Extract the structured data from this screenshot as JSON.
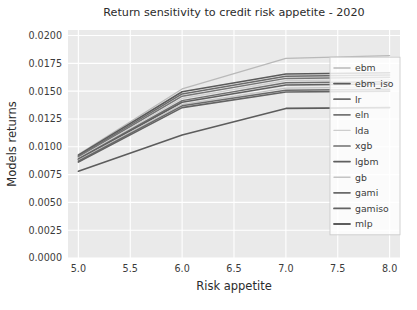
{
  "chart_data": {
    "type": "line",
    "title": "Return sensitivity to credit risk appetite - 2020",
    "xlabel": "Risk appetite",
    "ylabel": "Models returns",
    "xlim": [
      4.9,
      8.1
    ],
    "ylim": [
      0.0,
      0.0205
    ],
    "grid": true,
    "grid_color": "#ffffff",
    "plot_bg": "#eaeaea",
    "legend_position": "center right",
    "xticks": [
      5.0,
      5.5,
      6.0,
      6.5,
      7.0,
      7.5,
      8.0
    ],
    "xticklabels": [
      "5.0",
      "5.5",
      "6.0",
      "6.5",
      "7.0",
      "7.5",
      "8.0"
    ],
    "yticks": [
      0.0,
      0.0025,
      0.005,
      0.0075,
      0.01,
      0.0125,
      0.015,
      0.0175,
      0.02
    ],
    "yticklabels": [
      "0.0000",
      "0.0025",
      "0.0050",
      "0.0075",
      "0.0100",
      "0.0125",
      "0.0150",
      "0.0175",
      "0.0200"
    ],
    "x": [
      5.0,
      6.0,
      7.0,
      8.0
    ],
    "series": [
      {
        "name": "ebm",
        "color": "#b9b9b9",
        "width": 1.3,
        "values": [
          0.0093,
          0.0152,
          0.01795,
          0.0182
        ]
      },
      {
        "name": "ebm_iso",
        "color": "#5a5a5a",
        "width": 1.6,
        "values": [
          0.00925,
          0.01495,
          0.01655,
          0.01665
        ]
      },
      {
        "name": "lr",
        "color": "#6b6b6b",
        "width": 1.5,
        "values": [
          0.00915,
          0.01475,
          0.01635,
          0.01645
        ]
      },
      {
        "name": "eln",
        "color": "#757575",
        "width": 1.5,
        "values": [
          0.00908,
          0.01455,
          0.01615,
          0.01625
        ]
      },
      {
        "name": "lda",
        "color": "#cdcdcd",
        "width": 1.2,
        "values": [
          0.009,
          0.01435,
          0.01595,
          0.01605
        ]
      },
      {
        "name": "xgb",
        "color": "#6f6f6f",
        "width": 1.5,
        "values": [
          0.00892,
          0.01415,
          0.01575,
          0.01585
        ]
      },
      {
        "name": "lgbm",
        "color": "#5f5f5f",
        "width": 1.6,
        "values": [
          0.00885,
          0.014,
          0.01555,
          0.01565
        ]
      },
      {
        "name": "gb",
        "color": "#c4c4c4",
        "width": 1.2,
        "values": [
          0.00878,
          0.01382,
          0.01528,
          0.01538
        ]
      },
      {
        "name": "gami",
        "color": "#6a6a6a",
        "width": 1.5,
        "values": [
          0.0087,
          0.01368,
          0.01508,
          0.01518
        ]
      },
      {
        "name": "gamiso",
        "color": "#636363",
        "width": 1.6,
        "values": [
          0.00862,
          0.01352,
          0.01492,
          0.015
        ]
      },
      {
        "name": "mlp",
        "color": "#5c5c5c",
        "width": 1.6,
        "values": [
          0.0078,
          0.01105,
          0.01345,
          0.01352
        ]
      }
    ]
  }
}
